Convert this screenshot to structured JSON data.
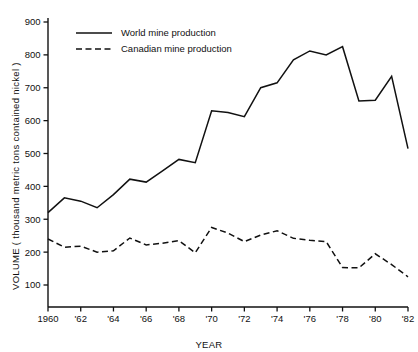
{
  "chart_data": {
    "type": "line",
    "title": "",
    "subtitle": "",
    "xlabel": "YEAR",
    "ylabel": "VOLUME ( thousand metric tons contained nickel )",
    "xlim": [
      1960,
      1982
    ],
    "ylim": [
      0,
      900
    ],
    "grid": false,
    "legend_position": "top-left",
    "x": [
      1960,
      1961,
      1962,
      1963,
      1964,
      1965,
      1966,
      1967,
      1968,
      1969,
      1970,
      1971,
      1972,
      1973,
      1974,
      1975,
      1976,
      1977,
      1978,
      1979,
      1980,
      1981,
      1982
    ],
    "xticks": [
      1960,
      1962,
      1964,
      1966,
      1968,
      1970,
      1972,
      1974,
      1976,
      1978,
      1980,
      1982
    ],
    "xticklabels": [
      "1960",
      "'62",
      "'64",
      "'66",
      "'68",
      "'70",
      "'72",
      "'74",
      "'76",
      "'78",
      "'80",
      "'82"
    ],
    "yticks": [
      100,
      200,
      300,
      400,
      500,
      600,
      700,
      800,
      900
    ],
    "yticklabels": [
      "100",
      "200",
      "300",
      "400",
      "500",
      "600",
      "700",
      "800",
      "900"
    ],
    "series": [
      {
        "name": "World mine production",
        "style": "solid",
        "color": "#111111",
        "values": [
          320,
          365,
          355,
          335,
          375,
          422,
          413,
          447,
          482,
          472,
          630,
          625,
          612,
          700,
          715,
          785,
          812,
          800,
          825,
          660,
          662,
          735,
          515
        ]
      },
      {
        "name": "Canadian mine production",
        "style": "dashed",
        "color": "#111111",
        "values": [
          240,
          215,
          218,
          200,
          204,
          243,
          222,
          227,
          235,
          198,
          275,
          258,
          232,
          252,
          265,
          242,
          236,
          232,
          153,
          152,
          195,
          162,
          125
        ]
      }
    ]
  },
  "legend": {
    "items": [
      {
        "label": "World mine production",
        "style": "solid"
      },
      {
        "label": "Canadian mine production",
        "style": "dashed"
      }
    ]
  }
}
